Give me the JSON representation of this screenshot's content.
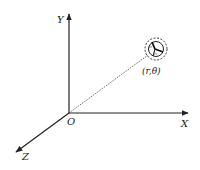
{
  "diagram": {
    "axes": {
      "x_label": "X",
      "y_label": "Y",
      "z_label": "Z",
      "origin_label": "O"
    },
    "point": {
      "label": "(r,θ)",
      "inner_labels": [
        "r₀",
        "r₁"
      ]
    },
    "colors": {
      "line": "#222222",
      "background": "#ffffff"
    }
  }
}
